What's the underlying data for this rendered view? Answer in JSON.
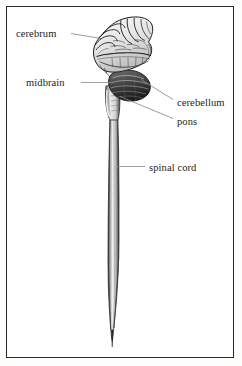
{
  "figure": {
    "background_color": "#ffffff",
    "frame_color": "#2a2a2a",
    "ink_color": "#1c1c1c",
    "leader_color": "#8d8d8d"
  },
  "labels": {
    "cerebrum": "cerebrum",
    "midbrain": "midbrain",
    "cerebellum": "cerebellum",
    "pons": "pons",
    "spinal_cord": "spinal cord"
  },
  "structures": [
    {
      "name": "cerebrum",
      "label": "cerebrum",
      "label_side": "left",
      "description": "Large folded mass at top of the figure showing gyri and sulci"
    },
    {
      "name": "midbrain",
      "label": "midbrain",
      "label_side": "left",
      "description": "Narrow stalk region below the cerebrum leading into the brainstem"
    },
    {
      "name": "cerebellum",
      "label": "cerebellum",
      "label_side": "right",
      "description": "Dark striated rounded mass below and behind the cerebrum"
    },
    {
      "name": "pons",
      "label": "pons",
      "label_side": "right",
      "description": "Bulge on the front of the brainstem above the spinal cord"
    },
    {
      "name": "spinal cord",
      "label": "spinal cord",
      "label_side": "right",
      "description": "Long narrow column descending from the brainstem, tapering to a point"
    }
  ]
}
